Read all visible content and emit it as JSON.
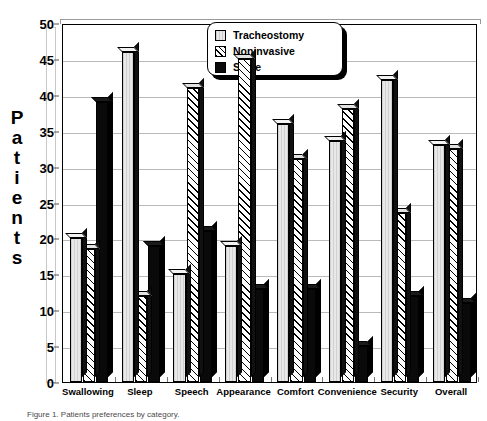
{
  "chart_data": {
    "type": "bar",
    "title": "",
    "xlabel": "",
    "ylabel": "Patients",
    "ylim": [
      0,
      50
    ],
    "ytick_step": 5,
    "yticks": [
      0,
      5,
      10,
      15,
      20,
      25,
      30,
      35,
      40,
      45,
      50
    ],
    "grid": true,
    "legend_position": "top-center",
    "categories": [
      "Swallowing",
      "Sleep",
      "Speech",
      "Appearance",
      "Comfort",
      "Convenience",
      "Security",
      "Overall"
    ],
    "series": [
      {
        "name": "Tracheostomy",
        "fill": "light-stipple",
        "values": [
          20,
          46,
          15,
          19,
          36,
          33.5,
          42,
          33
        ]
      },
      {
        "name": "Noninvasive",
        "fill": "diagonal-hatch",
        "values": [
          18.5,
          12,
          41,
          45,
          31,
          38,
          23.5,
          32.5
        ]
      },
      {
        "name": "Same",
        "fill": "solid-black",
        "values": [
          39,
          19,
          21,
          13,
          13,
          5,
          12,
          11
        ]
      }
    ]
  },
  "axis": {
    "y_title_letters": [
      "P",
      "a",
      "t",
      "i",
      "e",
      "n",
      "t",
      "s"
    ]
  },
  "legend": {
    "entries": [
      {
        "label": "Tracheostomy"
      },
      {
        "label": "Noninvasive"
      },
      {
        "label": "Same"
      }
    ]
  },
  "caption": {
    "text": "Figure 1. Patients preferences by category."
  },
  "colors": {
    "axis": "#000000",
    "grid": "#b9b9b9",
    "tracheostomy": "#e8e8e8",
    "noninvasive": "#ffffff",
    "same": "#0a0a0a"
  }
}
